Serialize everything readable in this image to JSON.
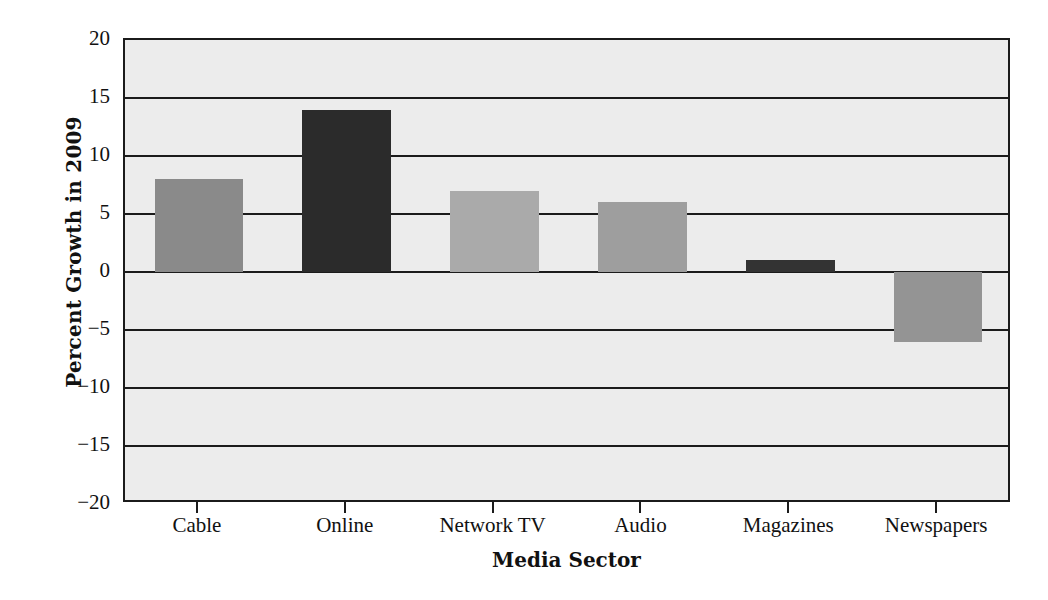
{
  "chart_data": {
    "type": "bar",
    "title": "",
    "xlabel": "Media Sector",
    "ylabel": "Percent Growth in 2009",
    "categories": [
      "Cable",
      "Online",
      "Network TV",
      "Audio",
      "Magazines",
      "Newspapers"
    ],
    "values": [
      8,
      14,
      7,
      6,
      1,
      -6
    ],
    "bar_colors": [
      "#8a8a8a",
      "#2b2b2b",
      "#aaaaaa",
      "#9e9e9e",
      "#333333",
      "#949494"
    ],
    "ylim": [
      -20,
      20
    ],
    "yticks": [
      20,
      15,
      10,
      5,
      0,
      -5,
      -10,
      -15,
      -20
    ],
    "ytick_labels": [
      "20",
      "15",
      "10",
      "5",
      "0",
      "−5",
      "−10",
      "−15",
      "−20"
    ],
    "grid": true,
    "legend": "none",
    "plot_background": "#ececec",
    "axis_color": "#1b1b1b"
  }
}
